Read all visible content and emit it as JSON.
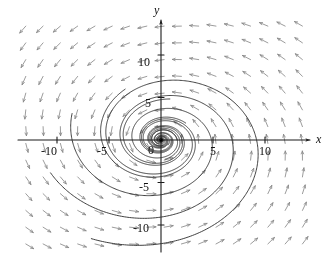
{
  "figure": {
    "type": "phase-portrait",
    "axis_labels": {
      "x": "x",
      "y": "y"
    },
    "origin_label": "0"
  },
  "chart_data": {
    "type": "scatter",
    "title": "",
    "xlabel": "x",
    "ylabel": "y",
    "xlim": [
      -13.8,
      14.4
    ],
    "ylim": [
      -15.4,
      14.5
    ],
    "grid": false,
    "legend": null,
    "x_ticks": [
      -10,
      -5,
      5,
      10
    ],
    "x_tick_labels": [
      "-10",
      "-5",
      "5",
      "10"
    ],
    "y_ticks": [
      10,
      5,
      -5,
      -10
    ],
    "y_tick_labels": [
      "10",
      "5",
      "-5",
      "-10"
    ],
    "origin_tick_label": "0",
    "system": {
      "form": "linear",
      "dx_dt": "a*x + b*y",
      "dy_dt": "c*x + d*y",
      "a": -0.18,
      "b": -1.0,
      "c": 1.0,
      "d": -0.18,
      "behavior": "stable spiral (inward clockwise-to-origin)"
    },
    "field": {
      "glyph": "arrow",
      "color": "#8a8a8a",
      "nx": 17,
      "ny": 15,
      "x_range": [
        -13.0,
        13.6
      ],
      "y_range": [
        -14.2,
        13.4
      ]
    },
    "trajectories": {
      "color": "#2b2b2b",
      "count": 9,
      "start_radii": [
        1.55,
        3.1,
        4.9,
        6.9,
        9.1,
        11.3,
        13.4,
        2.3,
        0.9
      ],
      "start_angles_deg": [
        0,
        40,
        80,
        120,
        160,
        200,
        240,
        280,
        320
      ],
      "turns": 2.35
    }
  },
  "tick_labels": {
    "x_neg10": "-10",
    "x_neg5": "-5",
    "x_pos5": "5",
    "x_pos10": "10",
    "y_pos10": "10",
    "y_pos5": "5",
    "y_neg5": "-5",
    "y_neg10": "-10",
    "origin": "0"
  },
  "axis_names": {
    "x": "x",
    "y": "y"
  },
  "colors": {
    "background": "#ffffff",
    "axis": "#1a1a1a",
    "field_arrow": "#8a8a8a",
    "trajectory": "#2b2b2b",
    "text": "#111111"
  }
}
